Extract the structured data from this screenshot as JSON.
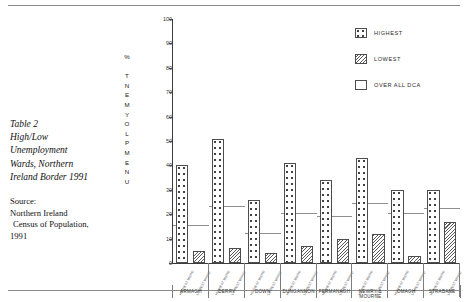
{
  "caption": {
    "lines": [
      "Table 2",
      "High/Low",
      "Unemployment",
      "Wards, Northern",
      "Ireland Border 1991"
    ]
  },
  "source": {
    "lines": [
      "Source:",
      "Northern Ireland",
      "Census of Population,",
      "1991"
    ]
  },
  "legend": {
    "items": [
      {
        "label": "HIGHEST",
        "swatch": "dotted-pattern-swatch"
      },
      {
        "label": "LOWEST",
        "swatch": "diagonal-hatch-swatch"
      },
      {
        "label": "OVER ALL DCA",
        "swatch": "empty-swatch"
      }
    ]
  },
  "chart_data": {
    "type": "bar",
    "title": "Table 2 High/Low Unemployment Wards, Northern Ireland Border 1991",
    "xlabel": "",
    "ylabel": "UNEMPLOYMENT %",
    "ylim": [
      0,
      100
    ],
    "yticks": [
      0,
      10,
      20,
      30,
      40,
      50,
      60,
      70,
      80,
      90,
      100
    ],
    "grid": false,
    "legend_position": "top-right",
    "categories": [
      "ARMAGH",
      "DERRY",
      "DOWN",
      "DUNGANNON",
      "FERMANAGH",
      "NEWRY & MOURNE",
      "OMAGH",
      "STRABANE"
    ],
    "series": [
      {
        "name": "HIGHEST",
        "values": [
          40,
          51,
          26,
          41,
          34,
          43,
          30,
          30
        ]
      },
      {
        "name": "LOWEST",
        "values": [
          5,
          6,
          4,
          7,
          10,
          12,
          3,
          17
        ]
      },
      {
        "name": "OVER ALL DCA",
        "values": [
          15,
          23,
          12,
          20,
          19,
          24,
          20,
          22
        ]
      }
    ],
    "ward_labels": [
      "HIGHEST WARD",
      "LOWEST WARD",
      "HIGHEST WARD",
      "LOWEST WARD",
      "HIGHEST WARD",
      "LOWEST WARD",
      "HIGHEST WARD",
      "LOWEST WARD",
      "HIGHEST WARD",
      "LOWEST WARD",
      "HIGHEST WARD",
      "LOWEST WARD",
      "HIGHEST WARD",
      "LOWEST WARD",
      "HIGHEST WARD",
      "LOWEST WARD"
    ]
  },
  "colors": {
    "axis": "#3d3d3d",
    "bar_outline": "#4d4d4d",
    "dca_line": "#8e8e8e",
    "text": "#1a1a1a",
    "rule": "#8a8a8a",
    "background": "#ffffff"
  }
}
